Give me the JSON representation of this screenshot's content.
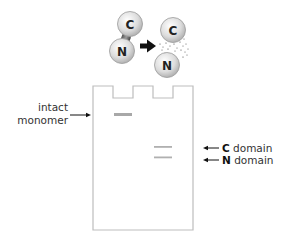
{
  "diagram": {
    "title": "",
    "molecule": {
      "intact": {
        "top_domain": "C",
        "bottom_domain": "N"
      },
      "cleaved": {
        "top_domain": "C",
        "bottom_domain": "N"
      },
      "process_arrow": "cleavage-arrow"
    },
    "gel": {
      "lanes": 2,
      "bands": [
        {
          "lane": 1,
          "label": "intact monomer",
          "position": "upper"
        },
        {
          "lane": 2,
          "label": "C domain",
          "position": "middle"
        },
        {
          "lane": 2,
          "label": "N domain",
          "position": "lower"
        }
      ]
    },
    "labels": {
      "intact_line1": "intact",
      "intact_line2": "monomer",
      "c_domain_bold": "C",
      "c_domain_rest": " domain",
      "n_domain_bold": "N",
      "n_domain_rest": " domain"
    },
    "colors": {
      "ball_fill": "#d9d9d9",
      "ball_stroke": "#9a9a9a",
      "band": "#a8a8a8",
      "gel_outline": "#bdbdbd",
      "arrow": "#111111"
    }
  }
}
